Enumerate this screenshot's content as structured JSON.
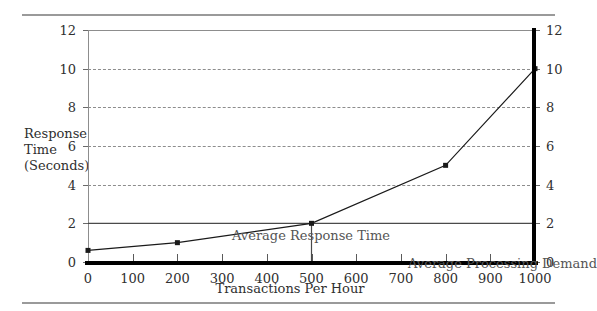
{
  "chart_data": {
    "type": "line",
    "title": "",
    "subtitle": "",
    "xlabel": "Transactions Per Hour",
    "ylabel": "Response\nTime\n(Seconds)",
    "ylabel_lines": [
      "Response",
      "Time",
      "(Seconds)"
    ],
    "xlim": [
      0,
      1000
    ],
    "ylim": [
      0,
      12
    ],
    "xticks": [
      0,
      100,
      200,
      300,
      400,
      500,
      600,
      700,
      800,
      900,
      1000
    ],
    "xtick_labels": [
      "0",
      "100",
      "200",
      "300",
      "400",
      "500",
      "600",
      "700",
      "800",
      "900",
      "1000"
    ],
    "yticks": [
      0,
      2,
      4,
      6,
      8,
      10,
      12
    ],
    "ytick_labels": [
      "0",
      "2",
      "4",
      "6",
      "8",
      "10",
      "12"
    ],
    "y_axis_right_labels": [
      "0",
      "2",
      "4",
      "6",
      "8",
      "10",
      "12"
    ],
    "grid": true,
    "gridlines_y": [
      2,
      4,
      6,
      8,
      10
    ],
    "legend": "none",
    "series": [
      {
        "name": "Response Time",
        "marker": "square",
        "color": "#1a1a1a",
        "x": [
          0,
          200,
          500,
          800,
          1000
        ],
        "values": [
          0.6,
          1.0,
          2.0,
          5.0,
          10.0
        ]
      }
    ],
    "reference_lines": [
      {
        "name": "Average Response Time",
        "orientation": "horizontal",
        "value": 2,
        "x_start": 0,
        "x_end": 1000,
        "color": "#4a4a4a"
      },
      {
        "name": "Average Processing Demand",
        "orientation": "vertical",
        "value": 500,
        "y_start": 0,
        "y_end": 2,
        "color": "#4a4a4a"
      }
    ],
    "annotations": [
      {
        "label": "Average Response Time",
        "x": 200,
        "y": 2.4
      },
      {
        "label": "Average Processing Demand",
        "x": 530,
        "y": 1.05
      }
    ]
  },
  "axis": {
    "x_title": "Transactions Per Hour",
    "y_title_line1": "Response",
    "y_title_line2": "Time",
    "y_title_line3": "(Seconds)"
  },
  "annotations": {
    "average_response_time": "Average Response Time",
    "average_processing_demand": "Average Processing Demand"
  },
  "colors": {
    "series": "#1a1a1a",
    "grid": "#8d8d8d",
    "axis": "#000000",
    "frame": "#8d8d8d",
    "text": "#2f2f2f",
    "annotation_text": "#555555",
    "rule": "#9a9a9a"
  }
}
